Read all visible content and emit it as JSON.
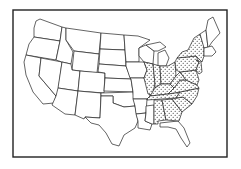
{
  "map": {
    "subject": "Contiguous United States outline map",
    "legend": null,
    "style": {
      "ink": "#222222",
      "paper": "#ffffff",
      "pattern": "stippled dots"
    },
    "highlighted_states": [
      "Illinois",
      "Indiana",
      "Ohio",
      "Kentucky",
      "Tennessee",
      "Alabama",
      "Georgia",
      "South Carolina",
      "North Carolina",
      "Virginia",
      "West Virginia",
      "Maryland",
      "Delaware",
      "Pennsylvania",
      "New Jersey",
      "New York"
    ],
    "unhighlighted_regions": [
      "West",
      "Great Plains",
      "Texas",
      "Louisiana",
      "Mississippi",
      "Florida",
      "Michigan",
      "Wisconsin",
      "Minnesota",
      "New England"
    ],
    "caption": ""
  }
}
